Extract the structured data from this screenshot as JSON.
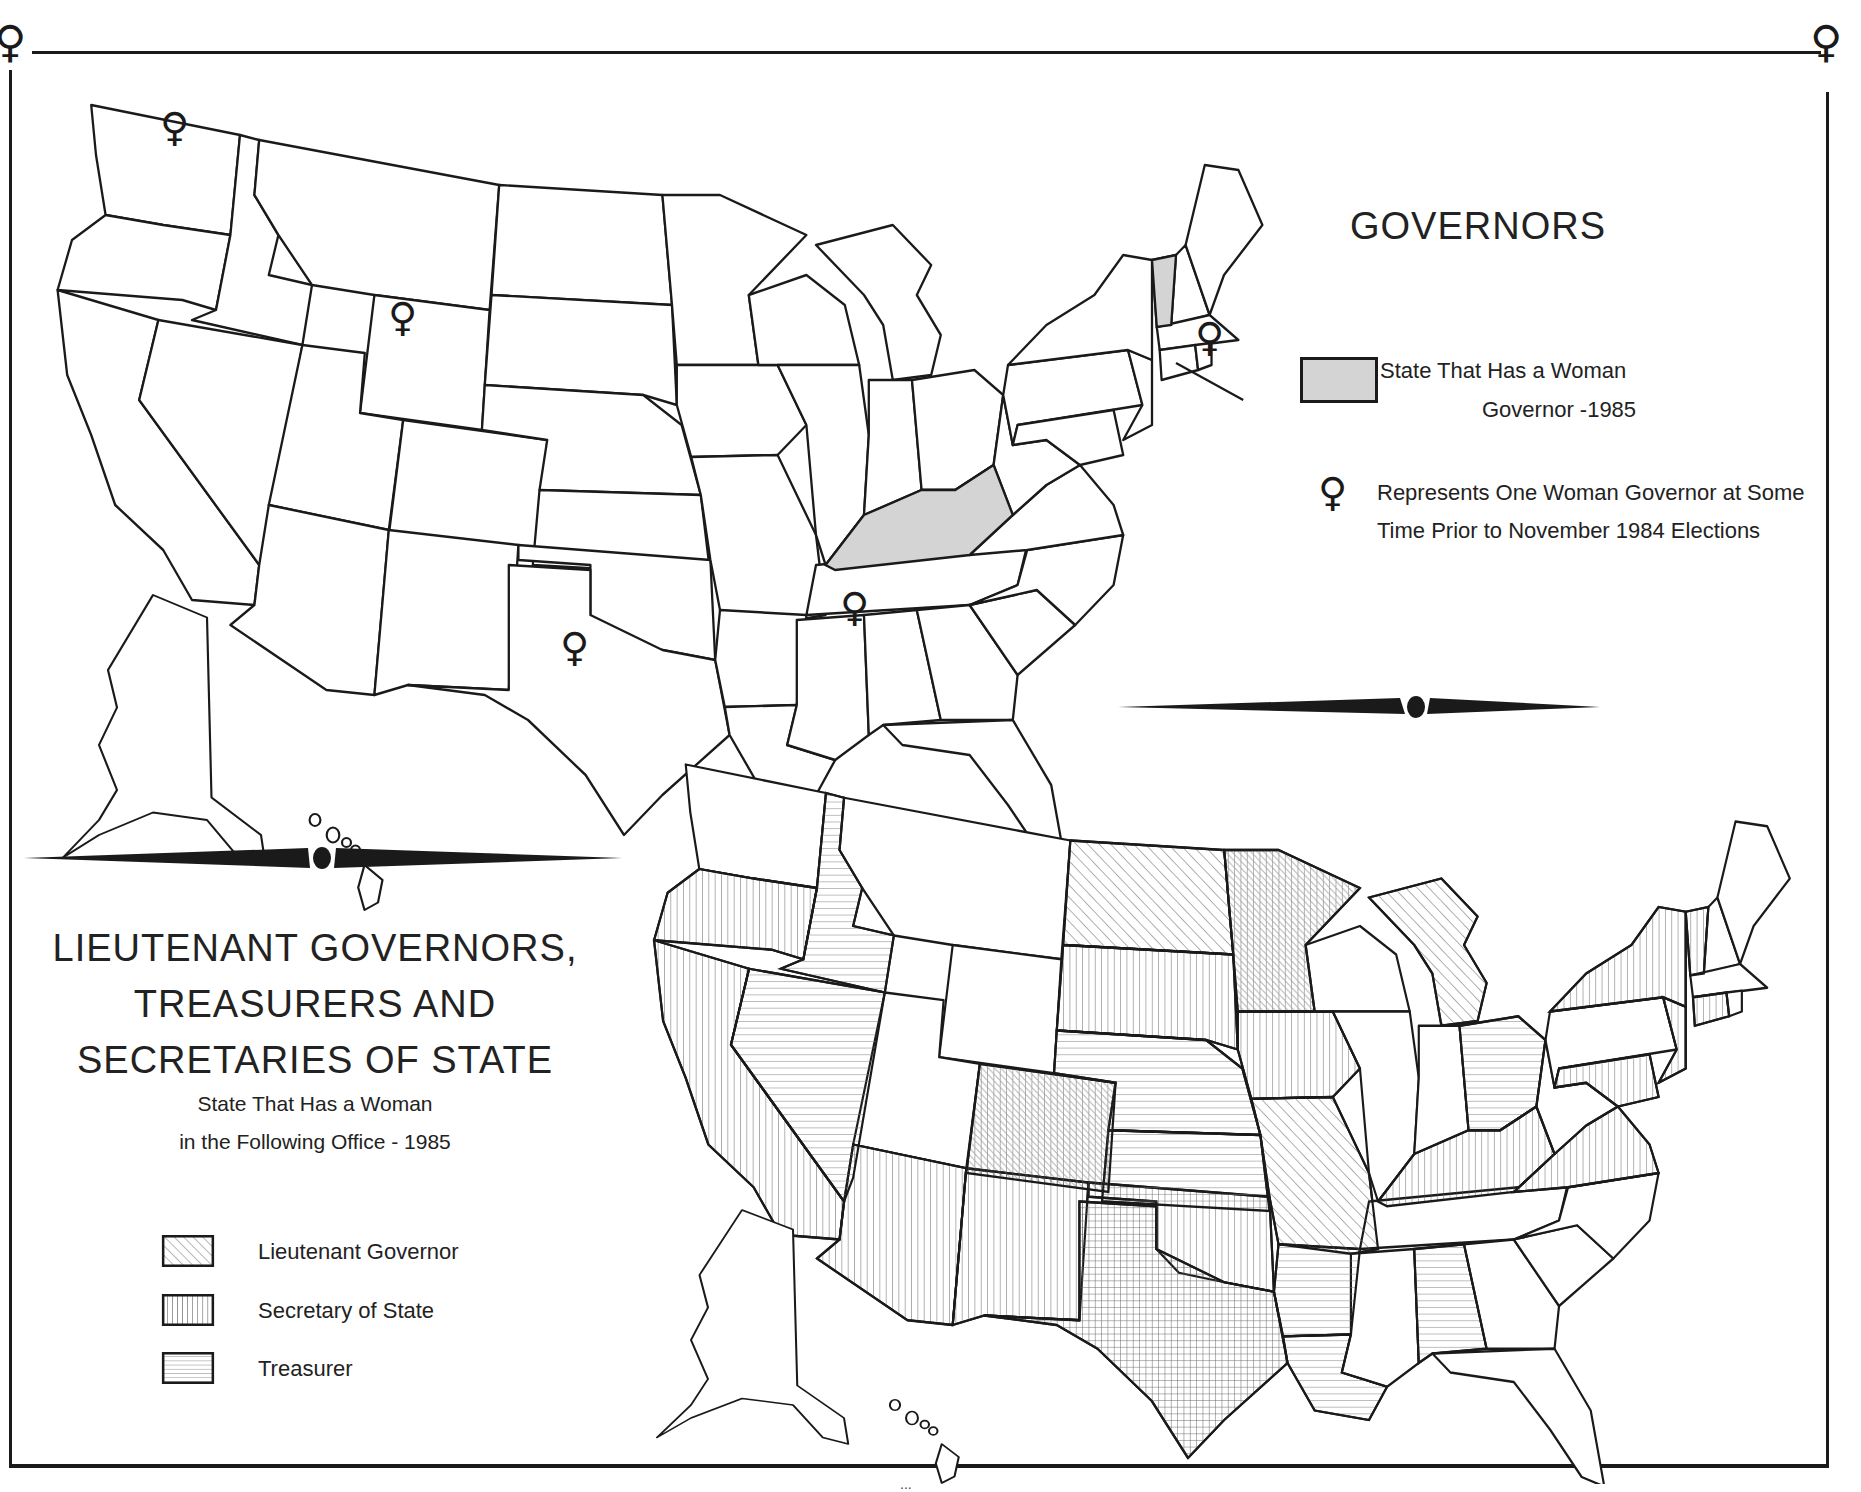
{
  "colors": {
    "ink": "#1a1a1a",
    "governor_fill": "#d4d4d4",
    "paper": "#ffffff"
  },
  "frame": {
    "corner_symbol": "♀",
    "corner_symbol_icon": "female-symbol-icon"
  },
  "governors_map": {
    "title": "GOVERNORS",
    "legend": {
      "shaded": {
        "line1": "State That Has a Woman",
        "line2": "Governor -1985",
        "fill": "#d4d4d4"
      },
      "symbol": {
        "glyph": "♀",
        "icon": "female-symbol-icon",
        "text": "Represents One Woman Governor at Some Time Prior to November 1984 Elections"
      }
    },
    "shaded_states": [
      "Kentucky",
      "Vermont"
    ],
    "symbol_states": [
      "Washington",
      "Wyoming",
      "Texas",
      "Alabama",
      "Connecticut"
    ]
  },
  "officers_map": {
    "title_lines": [
      "LIEUTENANT GOVERNORS,",
      "TREASURERS AND",
      "SECRETARIES OF STATE"
    ],
    "subtitle_lines": [
      "State That Has a Woman",
      "in the Following Office - 1985"
    ],
    "legend": [
      {
        "label": "Lieutenant Governor",
        "pattern": "diagonal"
      },
      {
        "label": "Secretary of State",
        "pattern": "vertical"
      },
      {
        "label": "Treasurer",
        "pattern": "horizontal"
      }
    ],
    "states": {
      "Lieutenant Governor": [
        "North Dakota",
        "Minnesota",
        "Colorado",
        "Missouri",
        "Michigan"
      ],
      "Secretary of State": [
        "Oregon",
        "California",
        "Arizona",
        "New Mexico",
        "South Dakota",
        "Minnesota",
        "Iowa",
        "Colorado",
        "Oklahoma",
        "Texas",
        "Kentucky",
        "Virginia",
        "New York",
        "Vermont",
        "Connecticut",
        "New Jersey",
        "Maryland"
      ],
      "Treasurer": [
        "Idaho",
        "Nevada",
        "Nebraska",
        "Kansas",
        "Texas",
        "Arkansas",
        "Louisiana",
        "Ohio",
        "Alabama"
      ]
    }
  },
  "page_number": "..."
}
